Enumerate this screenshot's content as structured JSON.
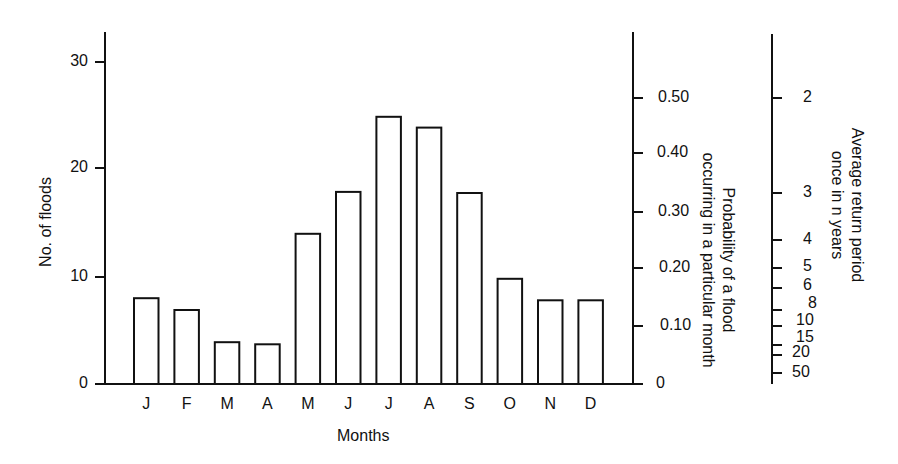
{
  "chart_data": {
    "type": "bar",
    "title": "",
    "xlabel": "Months",
    "ylabel": "No. of floods",
    "categories": [
      "J",
      "F",
      "M",
      "A",
      "M",
      "J",
      "J",
      "A",
      "S",
      "O",
      "N",
      "D"
    ],
    "values": [
      8,
      7,
      4,
      4,
      14,
      18,
      25,
      24,
      18,
      10,
      8,
      8
    ],
    "ylim": [
      0,
      30
    ],
    "yticks": [
      "0",
      "10",
      "20",
      "30"
    ],
    "secondary_axis": {
      "label_line1": "Probability of a flood",
      "label_line2": "occurring in a particular month",
      "ticks": [
        "0",
        "0.10",
        "0.20",
        "0.30",
        "0.40",
        "0.50"
      ],
      "tick_values": [
        0,
        0.1,
        0.2,
        0.3,
        0.4,
        0.5
      ]
    },
    "tertiary_axis": {
      "label_line1": "Average return period",
      "label_line2": "once in n years",
      "ticks": [
        "2",
        "3",
        "4",
        "5",
        "6",
        "8",
        "10",
        "15",
        "20",
        "50"
      ]
    },
    "grid": false,
    "legend": null,
    "bar_fill": "#ffffff",
    "bar_stroke": "#111111"
  }
}
